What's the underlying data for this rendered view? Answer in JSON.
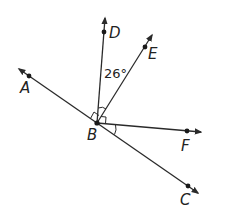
{
  "diagram": {
    "type": "geometry-angles",
    "colors": {
      "line": "#2a2a2a",
      "background": "#ffffff"
    },
    "vertex": {
      "name": "B",
      "x": 97,
      "y": 123
    },
    "points": [
      {
        "name": "A",
        "x": 29,
        "y": 76
      },
      {
        "name": "C",
        "x": 188,
        "y": 186
      },
      {
        "name": "D",
        "x": 104,
        "y": 32
      },
      {
        "name": "E",
        "x": 145,
        "y": 47
      },
      {
        "name": "F",
        "x": 187,
        "y": 131
      }
    ],
    "rays": [
      "BA",
      "BC",
      "BD",
      "BE",
      "BF"
    ],
    "annotations": {
      "angle_DBE": "26°",
      "right_angle_ABD": true,
      "right_angle_EBF": true,
      "angle_FBC_marked": true
    }
  },
  "labels": {
    "A": "A",
    "B": "B",
    "C": "C",
    "D": "D",
    "E": "E",
    "F": "F",
    "angle": "26°"
  }
}
